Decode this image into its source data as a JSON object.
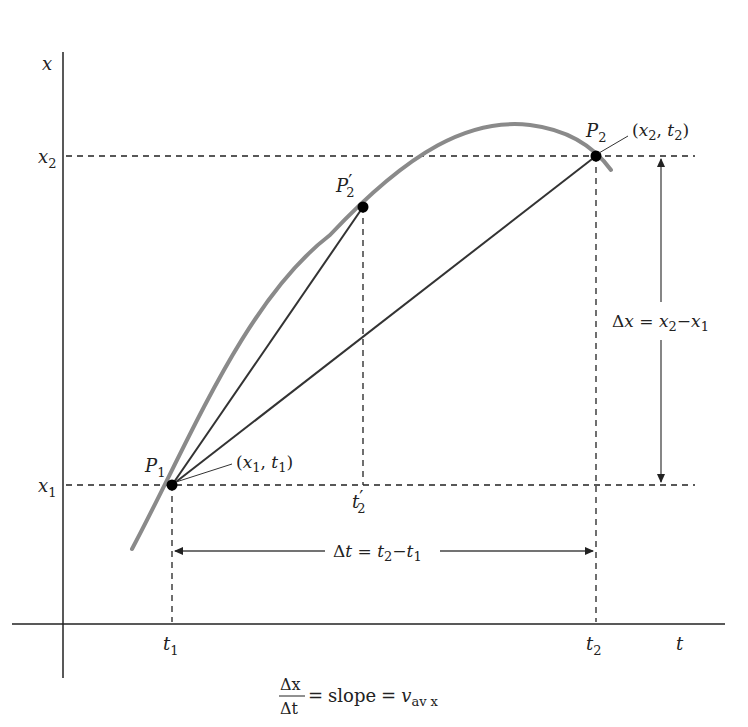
{
  "figure": {
    "axes": {
      "vertical_label": "x",
      "horizontal_label": "t"
    },
    "ticks": {
      "x2": {
        "base": "x",
        "sub": "2"
      },
      "x1": {
        "base": "x",
        "sub": "1"
      },
      "t1": {
        "base": "t",
        "sub": "1"
      },
      "t2": {
        "base": "t",
        "sub": "2"
      },
      "t2prime": {
        "base": "t",
        "prime": "′",
        "sub": "2"
      }
    },
    "points": {
      "P1": {
        "base": "P",
        "sub": "1",
        "coord_label": {
          "open": "(",
          "x": "x",
          "xsub": "1",
          "sep": ", ",
          "t": "t",
          "tsub": "1",
          "close": ")"
        }
      },
      "P2": {
        "base": "P",
        "sub": "2",
        "coord_label": {
          "open": "(",
          "x": "x",
          "xsub": "2",
          "sep": ", ",
          "t": "t",
          "tsub": "2",
          "close": ")"
        }
      },
      "P2prime": {
        "base": "P",
        "prime": "′",
        "sub": "2"
      }
    },
    "delta_x": {
      "delta": "Δ",
      "var": "x",
      "eq": " = ",
      "a": "x",
      "asub": "2",
      "minus": "−",
      "b": "x",
      "bsub": "1"
    },
    "delta_t": {
      "delta": "Δ",
      "var": "t",
      "eq": " = ",
      "a": "t",
      "asub": "2",
      "minus": "−",
      "b": "t",
      "bsub": "1"
    },
    "caption": {
      "num": "Δx",
      "den": "Δt",
      "eq1": "=",
      "word": "slope",
      "eq2": "=",
      "v": "v",
      "vsub": "av x"
    },
    "colors": {
      "curve": "#8a8a8a",
      "lines": "#333333",
      "points": "#000000"
    }
  }
}
